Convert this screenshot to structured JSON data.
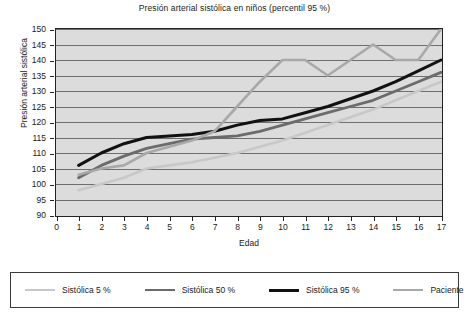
{
  "chart_data": {
    "type": "line",
    "title": "Presión arterial sistólica en niños (percentil 95 %)",
    "xlabel": "Edad",
    "ylabel": "Presión arterial sistólica",
    "xlim": [
      0,
      17
    ],
    "ylim": [
      90,
      150
    ],
    "ystep": 5,
    "xstep": 1,
    "grid": true,
    "legend_position": "bottom",
    "xticks": [
      "0",
      "1",
      "2",
      "3",
      "4",
      "5",
      "6",
      "7",
      "8",
      "9",
      "10",
      "11",
      "12",
      "13",
      "14",
      "15",
      "16",
      "17"
    ],
    "yticks": [
      "90",
      "95",
      "100",
      "105",
      "110",
      "115",
      "120",
      "125",
      "130",
      "135",
      "140",
      "145",
      "150"
    ],
    "x": [
      1,
      2,
      3,
      4,
      5,
      6,
      7,
      8,
      9,
      10,
      11,
      12,
      13,
      14,
      15,
      16,
      17
    ],
    "series": [
      {
        "name": "Sistólica 5 %",
        "color": "#c8c8c8",
        "width": 2.6,
        "values": [
          98,
          100,
          102,
          105,
          106,
          107,
          108.5,
          110,
          112,
          114,
          116.5,
          119,
          121.5,
          124,
          127,
          130,
          133
        ]
      },
      {
        "name": "Sistólica 50 %",
        "color": "#6b6b6b",
        "width": 2.8,
        "values": [
          102,
          106,
          109,
          111.5,
          113,
          114.5,
          115,
          115.5,
          117,
          119,
          121,
          123,
          125,
          127,
          130,
          133,
          136
        ]
      },
      {
        "name": "Sistólica 95 %",
        "color": "#111111",
        "width": 3.0,
        "values": [
          106,
          110,
          113,
          115,
          115.5,
          116,
          117,
          119,
          120.5,
          121,
          123,
          125,
          127.5,
          130,
          133,
          136.5,
          140
        ]
      },
      {
        "name": "Paciente",
        "color": "#a8a8a8",
        "width": 2.6,
        "values": [
          103,
          105,
          106,
          110,
          112,
          114,
          117,
          125,
          133,
          140,
          140,
          135,
          140,
          145,
          140,
          140,
          150
        ]
      }
    ]
  },
  "legend": {
    "items": [
      {
        "label": "Sistólica 5 %"
      },
      {
        "label": "Sistólica 50 %"
      },
      {
        "label": "Sistólica 95 %"
      },
      {
        "label": "Paciente"
      }
    ]
  }
}
